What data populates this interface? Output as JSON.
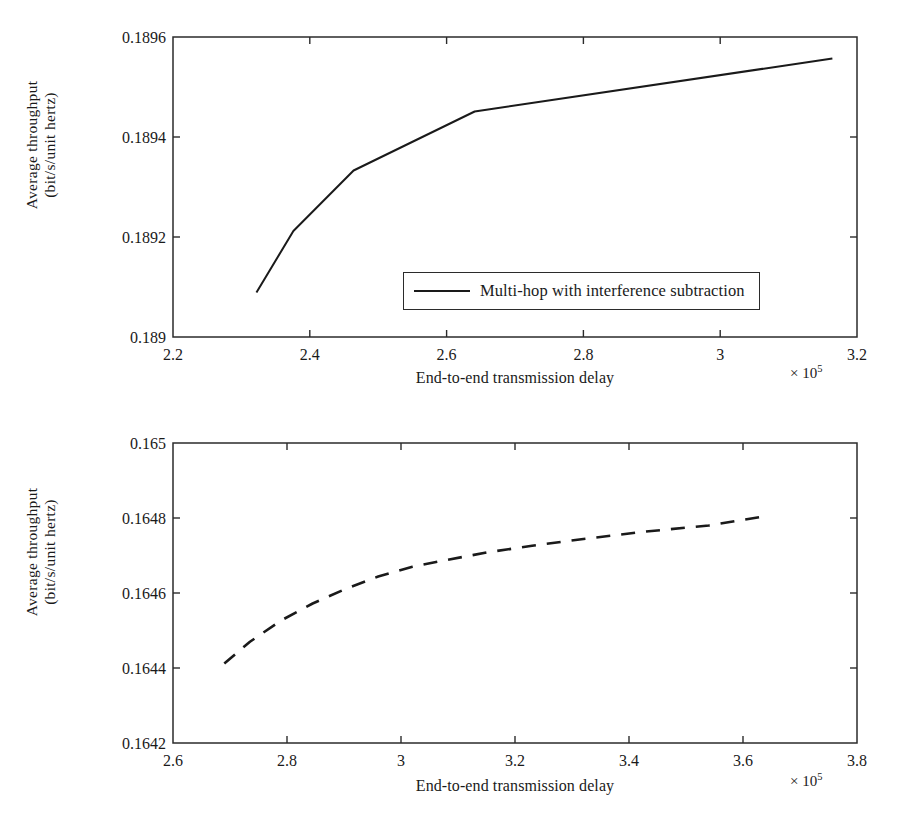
{
  "chart_data": [
    {
      "id": "top",
      "type": "line",
      "title": "",
      "xlabel": "End-to-end transmission delay",
      "ylabel_line1": "Average throughput",
      "ylabel_line2": "(bit/s/unit hertz)",
      "x_multiplier": "× 10",
      "x_multiplier_exponent": "5",
      "xlim": [
        2.2,
        3.2
      ],
      "ylim": [
        0.189,
        0.1896
      ],
      "xticks": [
        "2.2",
        "2.4",
        "2.6",
        "2.8",
        "3",
        "3.2"
      ],
      "xtick_values": [
        2.2,
        2.4,
        2.6,
        2.8,
        3.0,
        3.2
      ],
      "yticks": [
        "0.189",
        "0.1892",
        "0.1894",
        "0.1896"
      ],
      "ytick_values": [
        0.189,
        0.1892,
        0.1894,
        0.1896
      ],
      "grid": false,
      "legend_position": "lower right",
      "series": [
        {
          "name": "Multi-hop with interference subtraction",
          "style": "solid",
          "x": [
            2.322,
            2.376,
            2.464,
            2.641,
            3.164
          ],
          "y": [
            0.189089,
            0.189212,
            0.189333,
            0.189451,
            0.189557
          ]
        }
      ]
    },
    {
      "id": "bottom",
      "type": "line",
      "title": "",
      "xlabel": "End-to-end transmission delay",
      "ylabel_line1": "Average throughput",
      "ylabel_line2": "(bit/s/unit hertz)",
      "x_multiplier": "× 10",
      "x_multiplier_exponent": "5",
      "xlim": [
        2.6,
        3.8
      ],
      "ylim": [
        0.1642,
        0.165
      ],
      "xticks": [
        "2.6",
        "2.8",
        "3",
        "3.2",
        "3.4",
        "3.6",
        "3.8"
      ],
      "xtick_values": [
        2.6,
        2.8,
        3.0,
        3.2,
        3.4,
        3.6,
        3.8
      ],
      "yticks": [
        "0.1642",
        "0.1644",
        "0.1646",
        "0.1648",
        "0.165"
      ],
      "ytick_values": [
        0.1642,
        0.1644,
        0.1646,
        0.1648,
        0.165
      ],
      "grid": false,
      "legend_position": "lower right",
      "series": [
        {
          "name": "Multi-hop without interference subtraction",
          "style": "dashed",
          "x": [
            2.69,
            2.735,
            2.79,
            2.845,
            2.9,
            2.96,
            3.02,
            3.08,
            3.15,
            3.23,
            3.32,
            3.43,
            3.54,
            3.64
          ],
          "y": [
            0.164412,
            0.16447,
            0.164527,
            0.164572,
            0.164609,
            0.164644,
            0.16467,
            0.164688,
            0.164708,
            0.164726,
            0.164744,
            0.164764,
            0.16478,
            0.164805
          ]
        }
      ]
    }
  ],
  "style": {
    "axis_color": "#2b2b2b",
    "line_color": "#1a1a1a",
    "background": "#ffffff"
  }
}
